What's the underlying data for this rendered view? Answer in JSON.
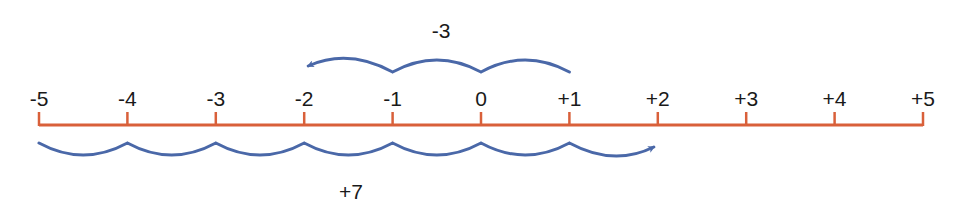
{
  "number_line": {
    "min": -5,
    "max": 5,
    "tick_labels": [
      "-5",
      "-4",
      "-3",
      "-2",
      "-1",
      "0",
      "+1",
      "+2",
      "+3",
      "+4",
      "+5"
    ],
    "axis_color": "#d9603a"
  },
  "jumps": [
    {
      "name": "jump-minus-3",
      "label": "-3",
      "start": 1,
      "end": -2,
      "side": "above",
      "color": "#4a68a8"
    },
    {
      "name": "jump-plus-7",
      "label": "+7",
      "start": -5,
      "end": 2,
      "side": "below",
      "color": "#4a68a8"
    }
  ]
}
